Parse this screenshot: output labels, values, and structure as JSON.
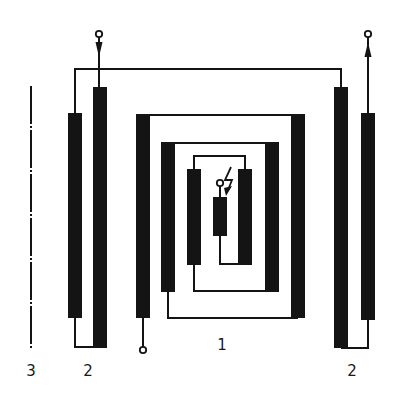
{
  "diagram": {
    "type": "schematic",
    "colors": {
      "ink": "#141414",
      "background": "#ffffff"
    },
    "labels": {
      "inner_winding": "1",
      "outer_winding_left": "2",
      "outer_winding_right": "2",
      "axis": "3"
    },
    "components": [
      {
        "id": "outer-pair-left",
        "label": "2"
      },
      {
        "id": "outer-pair-right",
        "label": "2"
      },
      {
        "id": "nested-spiral-winding",
        "label": "1"
      },
      {
        "id": "axis-line",
        "label": "3"
      },
      {
        "id": "central-element",
        "symbol": "resistor-with-spark"
      }
    ],
    "terminals": [
      {
        "id": "terminal-top-left",
        "direction": "input-arrow-down"
      },
      {
        "id": "terminal-top-right",
        "direction": "output-arrow-up"
      },
      {
        "id": "terminal-bottom",
        "direction": "lead"
      },
      {
        "id": "terminal-center",
        "direction": "lead"
      }
    ],
    "icons": {
      "spark": "lightning-bolt-icon"
    }
  }
}
